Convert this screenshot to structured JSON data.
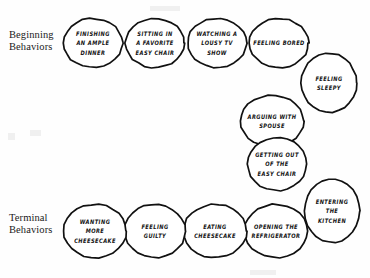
{
  "diagram": {
    "type": "behavior-chain",
    "background_color": "#fefefe",
    "ink_color": "#111111",
    "labels": {
      "beginning": "Beginning\nBehaviors",
      "terminal": "Terminal\nBehaviors"
    },
    "nodes": [
      {
        "id": "finishing-an-ample-dinner",
        "text": "Finishing\nan ample\ndinner",
        "x": 62,
        "y": 17,
        "w": 62,
        "h": 52,
        "rot": 0
      },
      {
        "id": "sitting-in-a-favorite-easy-chair",
        "text": "Sitting in\na favorite\neasy chair",
        "x": 124,
        "y": 17,
        "w": 62,
        "h": 52,
        "rot": 0
      },
      {
        "id": "watching-a-lousy-tv-show",
        "text": "Watching a\nlousy TV\nshow",
        "x": 186,
        "y": 17,
        "w": 62,
        "h": 52,
        "rot": 0
      },
      {
        "id": "feeling-bored",
        "text": "Feeling bored",
        "x": 248,
        "y": 17,
        "w": 62,
        "h": 52,
        "rot": 0
      },
      {
        "id": "feeling-sleepy",
        "text": "Feeling\nsleepy",
        "x": 300,
        "y": 52,
        "w": 58,
        "h": 62,
        "rot": 0
      },
      {
        "id": "arguing-with-spouse",
        "text": "Arguing with\nspouse",
        "x": 239,
        "y": 94,
        "w": 66,
        "h": 54,
        "rot": 0
      },
      {
        "id": "getting-out-of-the-easy-chair",
        "text": "Getting out\nof the\neasy chair",
        "x": 246,
        "y": 136,
        "w": 62,
        "h": 56,
        "rot": 0
      },
      {
        "id": "entering-the-kitchen",
        "text": "Entering\nthe\nkitchen",
        "x": 303,
        "y": 178,
        "w": 58,
        "h": 66,
        "rot": 0
      },
      {
        "id": "opening-the-refrigerator",
        "text": "Opening the\nrefrigerator",
        "x": 243,
        "y": 203,
        "w": 66,
        "h": 56,
        "rot": 0
      },
      {
        "id": "eating-cheesecake",
        "text": "Eating\ncheesecake",
        "x": 182,
        "y": 203,
        "w": 66,
        "h": 56,
        "rot": 0
      },
      {
        "id": "feeling-guilty",
        "text": "Feeling\nguilty",
        "x": 123,
        "y": 203,
        "w": 64,
        "h": 56,
        "rot": 0
      },
      {
        "id": "wanting-more-cheesecake",
        "text": "Wanting\nmore\ncheesecake",
        "x": 62,
        "y": 203,
        "w": 66,
        "h": 56,
        "rot": 0
      }
    ]
  }
}
